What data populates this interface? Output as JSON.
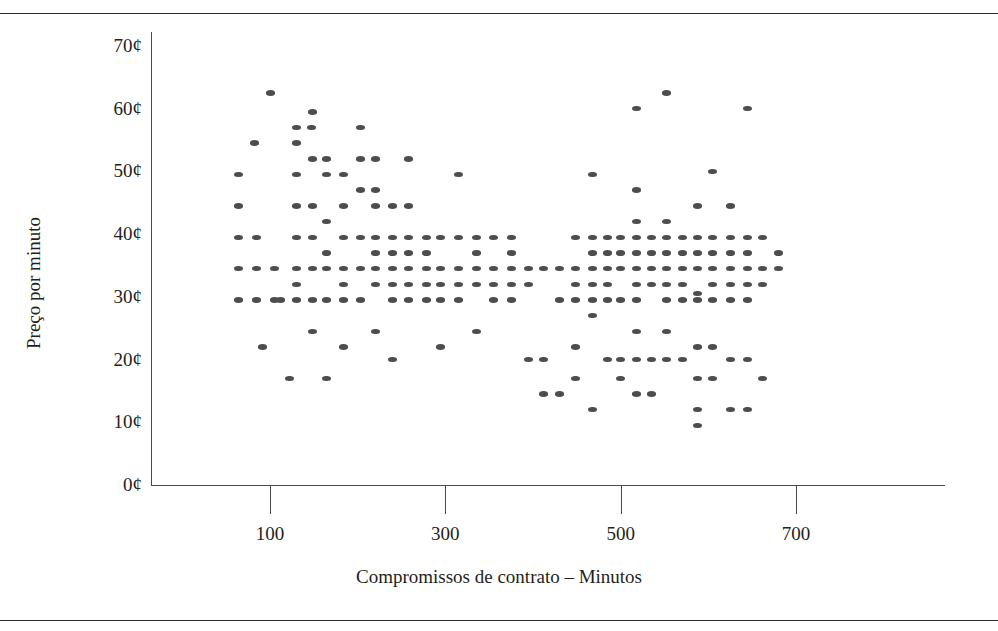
{
  "figure": {
    "title_note": "",
    "marker_color": "#4d4d4d",
    "axis_color": "#4a4a4a",
    "rule_color": "#2b2b2b"
  },
  "axes": {
    "xlabel": "Compromissos de contrato – Minutos",
    "ylabel": "Preço por minuto",
    "xticks": [
      {
        "value": 100,
        "label": "100"
      },
      {
        "value": 300,
        "label": "300"
      },
      {
        "value": 500,
        "label": "500"
      },
      {
        "value": 700,
        "label": "700"
      }
    ],
    "yticks": [
      {
        "value": 0,
        "label": "0¢"
      },
      {
        "value": 10,
        "label": "10¢"
      },
      {
        "value": 20,
        "label": "20¢"
      },
      {
        "value": 30,
        "label": "30¢"
      },
      {
        "value": 40,
        "label": "40¢"
      },
      {
        "value": 50,
        "label": "50¢"
      },
      {
        "value": 60,
        "label": "60¢"
      },
      {
        "value": 70,
        "label": "70¢"
      }
    ]
  },
  "chart_data": {
    "type": "scatter",
    "title": "",
    "xlabel": "Compromissos de contrato – Minutos",
    "ylabel": "Preço por minuto",
    "xlim": [
      -30,
      845
    ],
    "ylim": [
      0,
      70
    ],
    "xtick_labels": [
      "100",
      "300",
      "500",
      "700"
    ],
    "ytick_labels": [
      "0¢",
      "10¢",
      "20¢",
      "30¢",
      "40¢",
      "50¢",
      "60¢",
      "70¢"
    ],
    "grid": false,
    "legend": null,
    "marker": "ellipse",
    "marker_color": "#4d4d4d",
    "x_unit": "minutes",
    "y_unit": "cents per minute",
    "points": [
      [
        100,
        62.5
      ],
      [
        82,
        54.5
      ],
      [
        64,
        49.5
      ],
      [
        64,
        44.5
      ],
      [
        64,
        39.5
      ],
      [
        64,
        34.5
      ],
      [
        64,
        29.5
      ],
      [
        85,
        39.5
      ],
      [
        85,
        34.5
      ],
      [
        85,
        29.5
      ],
      [
        92,
        22.0
      ],
      [
        105,
        34.5
      ],
      [
        105,
        29.5
      ],
      [
        112,
        29.5
      ],
      [
        130,
        57.0
      ],
      [
        147,
        57.0
      ],
      [
        130,
        54.5
      ],
      [
        130,
        49.5
      ],
      [
        130,
        44.5
      ],
      [
        130,
        39.5
      ],
      [
        130,
        34.5
      ],
      [
        130,
        32.0
      ],
      [
        130,
        29.5
      ],
      [
        122,
        17.0
      ],
      [
        148,
        59.5
      ],
      [
        148,
        52.0
      ],
      [
        148,
        44.5
      ],
      [
        148,
        39.5
      ],
      [
        148,
        34.5
      ],
      [
        148,
        29.5
      ],
      [
        148,
        24.5
      ],
      [
        165,
        52.0
      ],
      [
        165,
        49.5
      ],
      [
        165,
        42.0
      ],
      [
        165,
        37.0
      ],
      [
        165,
        34.5
      ],
      [
        165,
        29.5
      ],
      [
        165,
        17.0
      ],
      [
        184,
        49.5
      ],
      [
        184,
        44.5
      ],
      [
        184,
        39.5
      ],
      [
        184,
        34.5
      ],
      [
        184,
        32.0
      ],
      [
        184,
        29.5
      ],
      [
        184,
        22.0
      ],
      [
        203,
        57.0
      ],
      [
        203,
        52.0
      ],
      [
        203,
        47.0
      ],
      [
        203,
        39.5
      ],
      [
        203,
        34.5
      ],
      [
        203,
        29.5
      ],
      [
        220,
        52.0
      ],
      [
        220,
        47.0
      ],
      [
        220,
        44.5
      ],
      [
        220,
        39.5
      ],
      [
        220,
        37.0
      ],
      [
        220,
        34.5
      ],
      [
        220,
        32.0
      ],
      [
        220,
        24.5
      ],
      [
        240,
        44.5
      ],
      [
        240,
        39.5
      ],
      [
        240,
        37.0
      ],
      [
        240,
        34.5
      ],
      [
        240,
        32.0
      ],
      [
        240,
        29.5
      ],
      [
        240,
        20.0
      ],
      [
        258,
        52.0
      ],
      [
        258,
        44.5
      ],
      [
        258,
        39.5
      ],
      [
        258,
        37.0
      ],
      [
        258,
        34.5
      ],
      [
        258,
        32.0
      ],
      [
        258,
        29.5
      ],
      [
        278,
        39.5
      ],
      [
        278,
        37.0
      ],
      [
        278,
        34.5
      ],
      [
        278,
        32.0
      ],
      [
        278,
        29.5
      ],
      [
        295,
        39.5
      ],
      [
        295,
        34.5
      ],
      [
        295,
        32.0
      ],
      [
        295,
        29.5
      ],
      [
        295,
        22.0
      ],
      [
        315,
        49.5
      ],
      [
        315,
        39.5
      ],
      [
        315,
        34.5
      ],
      [
        315,
        32.0
      ],
      [
        315,
        29.5
      ],
      [
        335,
        39.5
      ],
      [
        335,
        37.0
      ],
      [
        335,
        34.5
      ],
      [
        335,
        32.0
      ],
      [
        335,
        24.5
      ],
      [
        355,
        39.5
      ],
      [
        355,
        34.5
      ],
      [
        355,
        32.0
      ],
      [
        355,
        29.5
      ],
      [
        375,
        39.5
      ],
      [
        375,
        37.0
      ],
      [
        375,
        34.5
      ],
      [
        375,
        32.0
      ],
      [
        375,
        29.5
      ],
      [
        395,
        34.5
      ],
      [
        395,
        32.0
      ],
      [
        395,
        20.0
      ],
      [
        412,
        34.5
      ],
      [
        412,
        20.0
      ],
      [
        412,
        14.5
      ],
      [
        430,
        34.5
      ],
      [
        430,
        29.5
      ],
      [
        430,
        14.5
      ],
      [
        448,
        39.5
      ],
      [
        448,
        34.5
      ],
      [
        448,
        32.0
      ],
      [
        448,
        29.5
      ],
      [
        448,
        22.0
      ],
      [
        448,
        17.0
      ],
      [
        468,
        49.5
      ],
      [
        468,
        39.5
      ],
      [
        468,
        37.0
      ],
      [
        468,
        34.5
      ],
      [
        468,
        32.0
      ],
      [
        468,
        29.5
      ],
      [
        468,
        27.0
      ],
      [
        468,
        12.0
      ],
      [
        485,
        39.5
      ],
      [
        485,
        37.0
      ],
      [
        485,
        34.5
      ],
      [
        485,
        32.0
      ],
      [
        485,
        29.5
      ],
      [
        485,
        20.0
      ],
      [
        500,
        39.5
      ],
      [
        500,
        37.0
      ],
      [
        500,
        34.5
      ],
      [
        500,
        29.5
      ],
      [
        500,
        20.0
      ],
      [
        500,
        17.0
      ],
      [
        518,
        60.0
      ],
      [
        518,
        47.0
      ],
      [
        518,
        42.0
      ],
      [
        518,
        39.5
      ],
      [
        518,
        37.0
      ],
      [
        518,
        34.5
      ],
      [
        518,
        32.0
      ],
      [
        518,
        29.5
      ],
      [
        518,
        24.5
      ],
      [
        518,
        20.0
      ],
      [
        518,
        14.5
      ],
      [
        535,
        39.5
      ],
      [
        535,
        37.0
      ],
      [
        535,
        34.5
      ],
      [
        535,
        32.0
      ],
      [
        535,
        20.0
      ],
      [
        535,
        14.5
      ],
      [
        552,
        62.5
      ],
      [
        552,
        42.0
      ],
      [
        552,
        39.5
      ],
      [
        552,
        37.0
      ],
      [
        552,
        34.5
      ],
      [
        552,
        32.0
      ],
      [
        552,
        29.5
      ],
      [
        552,
        24.5
      ],
      [
        552,
        20.0
      ],
      [
        570,
        39.5
      ],
      [
        570,
        37.0
      ],
      [
        570,
        34.5
      ],
      [
        570,
        32.0
      ],
      [
        570,
        29.5
      ],
      [
        570,
        20.0
      ],
      [
        588,
        44.5
      ],
      [
        588,
        39.5
      ],
      [
        588,
        37.0
      ],
      [
        588,
        34.5
      ],
      [
        588,
        30.5
      ],
      [
        588,
        29.5
      ],
      [
        588,
        22.0
      ],
      [
        588,
        17.0
      ],
      [
        588,
        12.0
      ],
      [
        588,
        9.5
      ],
      [
        605,
        50.0
      ],
      [
        605,
        39.5
      ],
      [
        605,
        37.0
      ],
      [
        605,
        34.5
      ],
      [
        605,
        32.0
      ],
      [
        605,
        29.5
      ],
      [
        605,
        22.0
      ],
      [
        605,
        17.0
      ],
      [
        625,
        44.5
      ],
      [
        625,
        39.5
      ],
      [
        625,
        37.0
      ],
      [
        625,
        34.5
      ],
      [
        625,
        32.0
      ],
      [
        625,
        29.5
      ],
      [
        625,
        20.0
      ],
      [
        625,
        12.0
      ],
      [
        645,
        60.0
      ],
      [
        645,
        39.5
      ],
      [
        645,
        37.0
      ],
      [
        645,
        34.5
      ],
      [
        645,
        32.0
      ],
      [
        645,
        29.5
      ],
      [
        645,
        20.0
      ],
      [
        645,
        12.0
      ],
      [
        662,
        39.5
      ],
      [
        662,
        34.5
      ],
      [
        662,
        32.0
      ],
      [
        662,
        17.0
      ],
      [
        680,
        37.0
      ],
      [
        680,
        34.5
      ]
    ]
  }
}
